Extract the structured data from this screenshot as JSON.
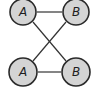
{
  "diagram": {
    "nodes": [
      {
        "id": "top-a",
        "label": "A"
      },
      {
        "id": "top-b",
        "label": "B"
      },
      {
        "id": "bottom-a",
        "label": "A"
      },
      {
        "id": "bottom-b",
        "label": "B"
      }
    ],
    "edges": [
      {
        "from": "top-a",
        "to": "top-b"
      },
      {
        "from": "bottom-a",
        "to": "bottom-b"
      },
      {
        "from": "top-a",
        "to": "bottom-b"
      },
      {
        "from": "top-b",
        "to": "bottom-a"
      }
    ],
    "colors": {
      "node_fill": "#d4d4d4",
      "node_stroke": "#2a2a2a",
      "edge": "#333333",
      "text": "#1e1e1e"
    }
  }
}
